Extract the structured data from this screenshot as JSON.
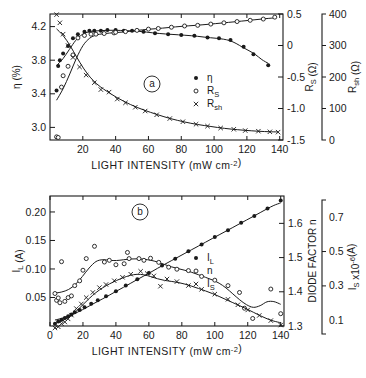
{
  "figure": {
    "panels": [
      "a",
      "b"
    ]
  },
  "chart_data": [
    {
      "type": "scatter",
      "panel_label": "(a)",
      "title": "",
      "xlabel": "LIGHT INTENSITY (mW cm⁻²)",
      "xlim": [
        0,
        142
      ],
      "xticks": [
        20,
        40,
        60,
        80,
        100,
        120,
        140
      ],
      "xticklabels": [
        "20",
        "40",
        "60",
        "80",
        "100",
        "120",
        "140"
      ],
      "grid": false,
      "legend_position": "center-right",
      "axes": [
        {
          "id": "eta",
          "side": "left",
          "label": "η (%)",
          "label_parts": {
            "base": "η",
            "unit": "(%)"
          },
          "lim": [
            2.85,
            4.35
          ],
          "ticks": [
            3.0,
            3.4,
            3.8,
            4.2
          ],
          "ticklabels": [
            "3.0",
            "3.4",
            "3.8",
            "4.2"
          ]
        },
        {
          "id": "rs",
          "side": "right",
          "label": "R_S (Ω)",
          "label_parts": {
            "base": "R",
            "sub": "S",
            "unit": "(Ω)"
          },
          "lim": [
            -1.5,
            0.5
          ],
          "ticks": [
            -1.5,
            -1.0,
            -0.5,
            0,
            0.5
          ],
          "ticklabels": [
            "-1.5",
            "-1.0",
            "-0.5",
            "0",
            "0.5"
          ]
        },
        {
          "id": "rsh",
          "side": "right-detached",
          "label": "R_sh (Ω)",
          "label_parts": {
            "base": "R",
            "sub": "sh",
            "unit": "(Ω)"
          },
          "lim": [
            0,
            400
          ],
          "ticks": [
            0,
            100,
            200,
            300,
            400
          ],
          "ticklabels": [
            "0",
            "100",
            "200",
            "300",
            "400"
          ]
        }
      ],
      "series": [
        {
          "name": "η",
          "legend_label": "η",
          "legend_parts": {
            "base": "η",
            "sub": ""
          },
          "marker": "filled-circle",
          "axis": "eta",
          "points": [
            [
              4,
              3.44
            ],
            [
              5,
              3.73
            ],
            [
              6,
              3.8
            ],
            [
              8,
              3.88
            ],
            [
              11,
              3.97
            ],
            [
              14,
              4.06
            ],
            [
              17,
              4.11
            ],
            [
              21,
              4.14
            ],
            [
              24,
              4.15
            ],
            [
              27,
              4.15
            ],
            [
              31,
              4.15
            ],
            [
              35,
              4.16
            ],
            [
              40,
              4.16
            ],
            [
              45,
              4.15
            ],
            [
              50,
              4.15
            ],
            [
              57,
              4.14
            ],
            [
              64,
              4.12
            ],
            [
              72,
              4.11
            ],
            [
              80,
              4.1
            ],
            [
              88,
              4.09
            ],
            [
              96,
              4.07
            ],
            [
              103,
              4.06
            ],
            [
              110,
              4.04
            ],
            [
              118,
              3.96
            ],
            [
              124,
              3.87
            ],
            [
              133,
              3.74
            ]
          ]
        },
        {
          "name": "R_S",
          "legend_label": "R_S",
          "legend_parts": {
            "base": "R",
            "sub": "S"
          },
          "marker": "open-circle",
          "axis": "rs",
          "points": [
            [
              4,
              -1.45
            ],
            [
              5,
              -1.46
            ],
            [
              7,
              -0.66
            ],
            [
              8,
              -0.48
            ],
            [
              11,
              -0.33
            ],
            [
              14,
              -0.15
            ],
            [
              17,
              0.12
            ],
            [
              21,
              0.16
            ],
            [
              25,
              0.18
            ],
            [
              28,
              0.18
            ],
            [
              33,
              0.19
            ],
            [
              39,
              0.2
            ],
            [
              40,
              0.21
            ],
            [
              46,
              0.22
            ],
            [
              53,
              0.24
            ],
            [
              60,
              0.26
            ],
            [
              66,
              0.27
            ],
            [
              74,
              0.29
            ],
            [
              82,
              0.31
            ],
            [
              90,
              0.32
            ],
            [
              98,
              0.34
            ],
            [
              106,
              0.36
            ],
            [
              114,
              0.38
            ],
            [
              122,
              0.4
            ],
            [
              130,
              0.42
            ],
            [
              137,
              0.45
            ]
          ]
        },
        {
          "name": "R_sh",
          "legend_label": "R_sh",
          "legend_parts": {
            "base": "R",
            "sub": "sh"
          },
          "marker": "x",
          "axis": "rsh",
          "points": [
            [
              4,
              398
            ],
            [
              6,
              372
            ],
            [
              8,
              336
            ],
            [
              11,
              300
            ],
            [
              14,
              262
            ],
            [
              18,
              232
            ],
            [
              22,
              206
            ],
            [
              27,
              182
            ],
            [
              31,
              160
            ],
            [
              36,
              152
            ],
            [
              41,
              130
            ],
            [
              46,
              118
            ],
            [
              52,
              104
            ],
            [
              58,
              92
            ],
            [
              65,
              80
            ],
            [
              73,
              68
            ],
            [
              81,
              58
            ],
            [
              89,
              50
            ],
            [
              96,
              44
            ],
            [
              104,
              38
            ],
            [
              112,
              34
            ],
            [
              119,
              30
            ],
            [
              127,
              28
            ],
            [
              134,
              26
            ],
            [
              139,
              25
            ]
          ]
        }
      ]
    },
    {
      "type": "scatter",
      "panel_label": "(b)",
      "title": "",
      "xlabel": "LIGHT INTENSITY (mW cm⁻²)",
      "xlim": [
        0,
        142
      ],
      "xticks": [
        0,
        20,
        40,
        60,
        80,
        100,
        120,
        140
      ],
      "xticklabels": [
        "0",
        "20",
        "40",
        "60",
        "80",
        "100",
        "120",
        "140"
      ],
      "grid": false,
      "legend_position": "center-right",
      "axes": [
        {
          "id": "il",
          "side": "left",
          "label": "I_L (A)",
          "label_parts": {
            "base": "I",
            "sub": "L",
            "unit": "(A)"
          },
          "lim": [
            0,
            0.228
          ],
          "ticks": [
            0.05,
            0.1,
            0.15,
            0.2
          ],
          "ticklabels": [
            "0.05",
            "0.10",
            "0.15",
            "0.20"
          ]
        },
        {
          "id": "n",
          "side": "right",
          "label": "DIODE FACTOR n",
          "label_parts": {
            "base": "DIODE FACTOR",
            "sub": "",
            "unit": "n"
          },
          "lim": [
            1.3,
            1.68
          ],
          "ticks": [
            1.3,
            1.4,
            1.5,
            1.6
          ],
          "ticklabels": [
            "1.3",
            "1.4",
            "1.5",
            "1.6"
          ]
        },
        {
          "id": "is",
          "side": "right-detached",
          "label": "I_S x10⁻⁶ (A)",
          "label_parts": {
            "base": "I",
            "sub": "S",
            "unit": "x10⁻⁶(A)"
          },
          "lim": [
            0.02,
            0.8
          ],
          "ticks": [
            0.1,
            0.3,
            0.5,
            0.7
          ],
          "ticklabels": [
            "0.1",
            "0.3",
            "0.5",
            "0.7"
          ]
        }
      ],
      "series": [
        {
          "name": "I_L",
          "legend_label": "I_L",
          "legend_parts": {
            "base": "I",
            "sub": "L"
          },
          "marker": "filled-circle",
          "axis": "il",
          "points": [
            [
              3,
              0.004
            ],
            [
              5,
              0.008
            ],
            [
              7,
              0.011
            ],
            [
              9,
              0.014
            ],
            [
              11,
              0.017
            ],
            [
              13,
              0.02
            ],
            [
              15,
              0.024
            ],
            [
              18,
              0.028
            ],
            [
              21,
              0.033
            ],
            [
              25,
              0.039
            ],
            [
              29,
              0.045
            ],
            [
              34,
              0.052
            ],
            [
              40,
              0.061
            ],
            [
              46,
              0.071
            ],
            [
              53,
              0.082
            ],
            [
              60,
              0.093
            ],
            [
              68,
              0.106
            ],
            [
              76,
              0.118
            ],
            [
              84,
              0.131
            ],
            [
              92,
              0.143
            ],
            [
              100,
              0.156
            ],
            [
              108,
              0.168
            ],
            [
              116,
              0.181
            ],
            [
              124,
              0.193
            ],
            [
              132,
              0.206
            ],
            [
              140,
              0.22
            ]
          ]
        },
        {
          "name": "n",
          "legend_label": "n",
          "legend_parts": {
            "base": "n",
            "sub": ""
          },
          "marker": "open-circle",
          "axis": "n",
          "points": [
            [
              3,
              1.395
            ],
            [
              4,
              1.375
            ],
            [
              5,
              1.382
            ],
            [
              6,
              1.368
            ],
            [
              7,
              1.488
            ],
            [
              9,
              1.372
            ],
            [
              11,
              1.383
            ],
            [
              13,
              1.388
            ],
            [
              15,
              1.418
            ],
            [
              18,
              1.432
            ],
            [
              20,
              1.463
            ],
            [
              22,
              1.497
            ],
            [
              27,
              1.533
            ],
            [
              33,
              1.487
            ],
            [
              36,
              1.492
            ],
            [
              40,
              1.479
            ],
            [
              45,
              1.482
            ],
            [
              47,
              1.515
            ],
            [
              48,
              1.497
            ],
            [
              54,
              1.497
            ],
            [
              57,
              1.492
            ],
            [
              61,
              1.498
            ],
            [
              66,
              1.486
            ],
            [
              72,
              1.472
            ],
            [
              77,
              1.466
            ],
            [
              84,
              1.462
            ],
            [
              92,
              1.445
            ],
            [
              100,
              1.434
            ],
            [
              108,
              1.418
            ],
            [
              115,
              1.398
            ],
            [
              118,
              1.352
            ],
            [
              123,
              1.322
            ],
            [
              134,
              1.408
            ],
            [
              140,
              1.336
            ]
          ]
        },
        {
          "name": "I_S",
          "legend_label": "I_S",
          "legend_parts": {
            "base": "I",
            "sub": "S"
          },
          "marker": "x",
          "axis": "is",
          "points": [
            [
              3,
              0.055
            ],
            [
              5,
              0.062
            ],
            [
              7,
              0.08
            ],
            [
              9,
              0.09
            ],
            [
              11,
              0.108
            ],
            [
              13,
              0.13
            ],
            [
              16,
              0.168
            ],
            [
              19,
              0.195
            ],
            [
              22,
              0.232
            ],
            [
              26,
              0.262
            ],
            [
              30,
              0.29
            ],
            [
              34,
              0.308
            ],
            [
              39,
              0.33
            ],
            [
              44,
              0.35
            ],
            [
              49,
              0.368
            ],
            [
              55,
              0.385
            ],
            [
              59,
              0.372
            ],
            [
              63,
              0.358
            ],
            [
              67,
              0.298
            ],
            [
              71,
              0.34
            ],
            [
              77,
              0.325
            ],
            [
              84,
              0.302
            ],
            [
              92,
              0.28
            ],
            [
              100,
              0.252
            ],
            [
              108,
              0.222
            ],
            [
              114,
              0.19
            ],
            [
              120,
              0.16
            ],
            [
              127,
              0.128
            ],
            [
              134,
              0.098
            ],
            [
              140,
              0.072
            ]
          ]
        }
      ]
    }
  ]
}
